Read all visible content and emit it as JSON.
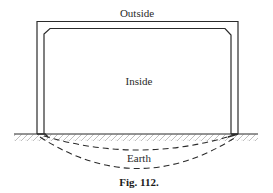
{
  "figure": {
    "caption": "Fig. 112.",
    "labels": {
      "outside": "Outside",
      "inside": "Inside",
      "earth": "Earth"
    },
    "colors": {
      "line": "#2b2b2b",
      "hatch": "#8a8a8a",
      "background": "#ffffff"
    },
    "elements": {
      "outer_frame": "U-shaped outer wall outline (inverted U) standing on ground",
      "inner_frame": "inner wall outline with chamfered top corners",
      "ground_line": "horizontal ground surface with earth hatching below",
      "field_lines": "two dashed curved arcs under the ground between wall feet"
    }
  }
}
